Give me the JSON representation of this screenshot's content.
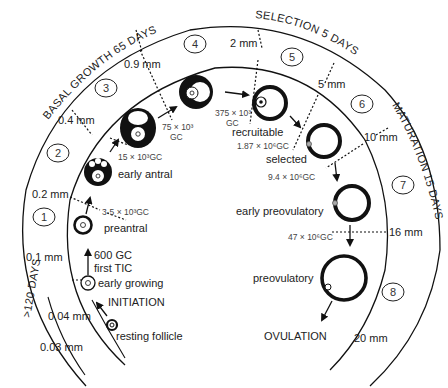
{
  "phases": {
    "basal": "BASAL GROWTH 65 DAYS",
    "selection": "SELECTION 5 DAYS",
    "maturation": "MATURATION 15 DAYS",
    "early": ">120 DAYS"
  },
  "stages": [
    "1",
    "2",
    "3",
    "4",
    "5",
    "6",
    "7",
    "8"
  ],
  "sizes": {
    "s003": "0.03 mm",
    "s004": "0.04 mm",
    "s01": "0.1 mm",
    "s02": "0.2 mm",
    "s04": "0.4 mm",
    "s09": "0.9 mm",
    "s2": "2 mm",
    "s5": "5 mm",
    "s10": "10 mm",
    "s16": "16 mm",
    "s20": "20 mm"
  },
  "follicles": {
    "resting": "resting follicle",
    "early_growing": "early growing",
    "preantral": "preantral",
    "early_antral": "early antral",
    "recruitable": "recruitable",
    "selected": "selected",
    "early_preovulatory": "early preovulatory",
    "preovulatory": "preovulatory"
  },
  "events": {
    "initiation": "INITIATION",
    "ovulation": "OVULATION",
    "first_tic": "first TIC"
  },
  "gc_counts": {
    "gc600": "600 GC",
    "gc3_5": "3·5 × 10³GC",
    "gc15": "15 × 10³GC",
    "gc75a": "75 × 10³",
    "gc75b": "GC",
    "gc375a": "375 × 10³",
    "gc375b": "GC",
    "gc187": "1.87 × 10⁶GC",
    "gc94": "9.4 × 10⁶GC",
    "gc47": "47 × 10⁶GC"
  }
}
